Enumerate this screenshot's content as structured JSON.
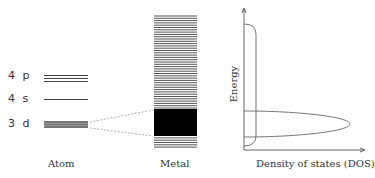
{
  "diagram": {
    "atom": {
      "caption": "Atom",
      "levels": [
        {
          "label": "4 p",
          "y": 77
        },
        {
          "label": "4 s",
          "y": 99
        },
        {
          "label": "3 d",
          "y": 124
        }
      ]
    },
    "metal": {
      "caption": "Metal"
    },
    "dos": {
      "y_axis_label": "Energy",
      "x_axis_label": "Density of states (DOS)"
    },
    "colors": {
      "line": "#444444",
      "band_fill": "#000000",
      "dashed": "#999999",
      "axis": "#555555"
    }
  }
}
